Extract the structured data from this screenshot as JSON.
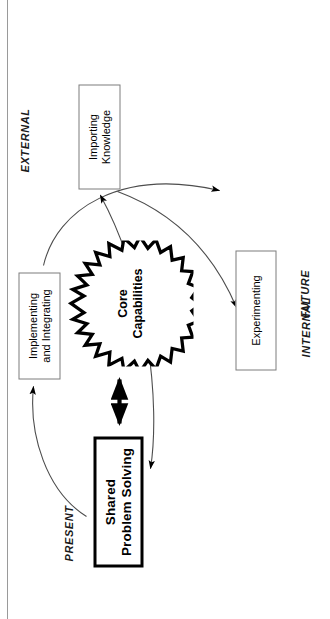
{
  "diagram": {
    "type": "cycle-diagram",
    "title": "",
    "orientation": "rotated-90-counter-clockwise",
    "center": {
      "id": "core-capabilities",
      "shape": "starburst",
      "label_line1": "Core",
      "label_line2": "Capabilities",
      "label": "Core Capabilities",
      "emphasis": "bold",
      "stroke_color": "#000000"
    },
    "nodes": [
      {
        "id": "shared-problem-solving",
        "label_line1": "Shared",
        "label_line2": "Problem Solving",
        "label": "Shared Problem Solving",
        "emphasis": "bold",
        "border": "thick",
        "border_color": "#000000",
        "position": "present"
      },
      {
        "id": "implementing-and-integrating",
        "label_line1": "Implementing",
        "label_line2": "and Integrating",
        "label": "Implementing and Integrating",
        "emphasis": "normal",
        "border": "thin",
        "border_color": "#7d7d7d",
        "position": "internal"
      },
      {
        "id": "experimenting",
        "label_line1": "Experimenting",
        "label_line2": "",
        "label": "Experimenting",
        "emphasis": "normal",
        "border": "thin",
        "border_color": "#7d7d7d",
        "position": "future"
      },
      {
        "id": "importing-knowledge",
        "label_line1": "Importing",
        "label_line2": "Knowledge",
        "label": "Importing Knowledge",
        "emphasis": "normal",
        "border": "thin",
        "border_color": "#7d7d7d",
        "position": "external"
      }
    ],
    "axis_labels": [
      {
        "id": "present",
        "text": "PRESENT"
      },
      {
        "id": "internal",
        "text": "INTERNAL"
      },
      {
        "id": "future",
        "text": "FUTURE"
      },
      {
        "id": "external",
        "text": "EXTERNAL"
      }
    ],
    "connectors": [
      {
        "id": "shared-to-implementing",
        "from": "shared-problem-solving",
        "to": "implementing-and-integrating",
        "style": "curved",
        "arrowheads": "end"
      },
      {
        "id": "implementing-to-experimenting",
        "from": "implementing-and-integrating",
        "to": "experimenting",
        "style": "curved",
        "arrowheads": "end"
      },
      {
        "id": "importing-to-experimenting",
        "from": "importing-knowledge",
        "to": "experimenting",
        "style": "curved",
        "arrowheads": "end"
      },
      {
        "id": "importing-to-shared",
        "from": "importing-knowledge",
        "to": "shared-problem-solving",
        "style": "curved",
        "arrowheads": "both"
      },
      {
        "id": "shared-to-core",
        "from": "shared-problem-solving",
        "to": "core-capabilities",
        "style": "straight",
        "arrowheads": "both",
        "weight": "bold"
      }
    ]
  }
}
